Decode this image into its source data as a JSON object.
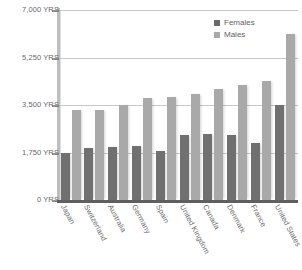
{
  "chart_data": {
    "type": "bar",
    "title": "",
    "subtitle": "",
    "xlabel": "",
    "ylabel": "",
    "grid": true,
    "legend_position": "top-right",
    "ylim": [
      0,
      7000
    ],
    "yticks": [
      0,
      1750,
      3500,
      5250,
      7000
    ],
    "ytick_labels": [
      "0 YRS",
      "1,750 YRS",
      "3,500 YRS",
      "5,250 YRS",
      "7,000 YRS"
    ],
    "unit": "YRS",
    "categories": [
      "Japan",
      "Switzerland",
      "Australia",
      "Germany",
      "Spain",
      "United Kingdom",
      "Canada",
      "Denmark",
      "France",
      "United States"
    ],
    "series": [
      {
        "name": "Females",
        "color": "#707070",
        "values": [
          1750,
          1900,
          1950,
          2000,
          1800,
          2400,
          2450,
          2400,
          2100,
          3500
        ]
      },
      {
        "name": "Males",
        "color": "#a9a9a9",
        "values": [
          3300,
          3300,
          3500,
          3750,
          3800,
          3900,
          4100,
          4250,
          4400,
          6100
        ]
      }
    ]
  },
  "legend": {
    "items": [
      {
        "label": "Females",
        "swatch": "females"
      },
      {
        "label": "Males",
        "swatch": "males"
      }
    ]
  },
  "colors": {
    "females": "#707070",
    "males": "#a9a9a9",
    "gridline": "#c9c9c9",
    "axis": "#5f5f5f",
    "text": "#6a6a6a",
    "background": "#ffffff"
  }
}
